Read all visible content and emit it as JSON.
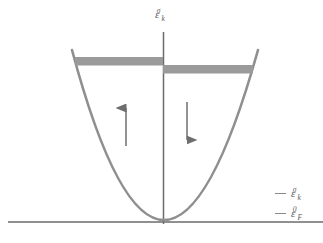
{
  "figure": {
    "domain": "diagram",
    "background_color": "#ffffff",
    "width": 323,
    "height": 243
  },
  "axes": {
    "vertical_axis": {
      "name": "energy-axis",
      "x": 163,
      "y_top": 32,
      "y_bottom": 224,
      "color": "#6b6b6b",
      "label": {
        "symbol": "ε",
        "subscript": "k",
        "superscript": "σ",
        "plain": "ε_k^σ"
      }
    },
    "horizontal_axis": {
      "name": "fermi-level-axis",
      "y": 222,
      "x_left": 8,
      "x_right": 323,
      "color": "#6b6b6b",
      "label": {
        "symbol": "ε",
        "subscript": "F",
        "superscript": "0",
        "plain": "ε_F^0"
      }
    }
  },
  "curve": {
    "name": "parabolic-dispersion",
    "type": "parabola",
    "color": "#8f8f8f",
    "stroke_width": 2.6,
    "vertex": {
      "x": 163,
      "y": 222
    },
    "left_end": {
      "x": 72,
      "y": 50
    },
    "right_end": {
      "x": 258,
      "y": 50
    }
  },
  "bands": [
    {
      "name": "spin-up-filled-band",
      "spin": "up",
      "x_start": 75,
      "x_end": 163,
      "y_top": 57,
      "y_bottom": 65,
      "color": "#9a9a9a"
    },
    {
      "name": "spin-down-filled-band",
      "spin": "down",
      "x_start": 163,
      "x_end": 253,
      "y_top": 65,
      "y_bottom": 73,
      "color": "#9a9a9a"
    }
  ],
  "arrows": [
    {
      "name": "spin-up-arrow",
      "direction": "up",
      "x": 126,
      "y_tail": 146,
      "y_head": 97,
      "color": "#6e6e6e"
    },
    {
      "name": "spin-down-arrow",
      "direction": "down",
      "x": 187,
      "y_tail": 102,
      "y_head": 151,
      "color": "#6e6e6e"
    }
  ],
  "legend": {
    "position": "bottom-right",
    "items": [
      {
        "name": "legend-energy-dispersion",
        "symbol": "ε",
        "subscript": "k",
        "superscript": "σ",
        "plain": "ε_k^σ",
        "dash_color": "#8a8a8a"
      },
      {
        "name": "legend-fermi-level",
        "symbol": "ε",
        "subscript": "F",
        "superscript": "0",
        "plain": "ε_F^0",
        "dash_color": "#8a8a8a"
      }
    ]
  }
}
